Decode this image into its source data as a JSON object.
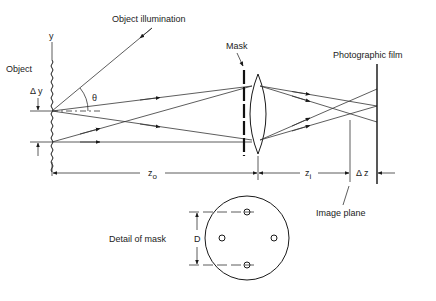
{
  "diagram": {
    "labels": {
      "object_illumination": "Object illumination",
      "y_axis": "y",
      "object": "Object",
      "delta_y": "Δ y",
      "theta": "θ",
      "mask": "Mask",
      "photographic_film": "Photographic   film",
      "z_o": "z",
      "z_o_sub": "o",
      "z_i": "z",
      "z_i_sub": "i",
      "delta_z": "Δ z",
      "image_plane": "Image plane",
      "detail_of_mask": "Detail of mask",
      "D": "D"
    },
    "colors": {
      "line": "#1a1a1a",
      "background": "#ffffff"
    }
  }
}
